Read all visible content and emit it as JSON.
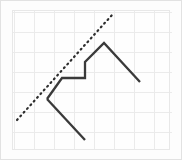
{
  "figure": {
    "width": 182,
    "height": 160,
    "background_color": "#fdfdfd",
    "plot_background_color": "#fefefe",
    "border_color": "#e2e2e2",
    "title": "",
    "caption": ""
  },
  "grid": {
    "visible": true,
    "spacing_px": 20,
    "color": "#ebebeb",
    "line_width": 1,
    "x_start": 14,
    "y_start": 12,
    "x_end": 170,
    "y_end": 148
  },
  "chart_data": {
    "type": "line",
    "title": "",
    "subtitle": "",
    "xlabel": "",
    "ylabel": "",
    "xlim": [
      0,
      182
    ],
    "ylim": [
      160,
      0
    ],
    "grid": true,
    "legend_position": "none",
    "tick_labels_visible": false,
    "x_ticks": [
      14,
      34,
      54,
      74,
      94,
      114,
      134,
      154,
      170
    ],
    "y_ticks": [
      12,
      32,
      52,
      72,
      92,
      112,
      132,
      148
    ],
    "series": [
      {
        "name": "zigzag-polyline",
        "style": "solid",
        "color": "#3a3a3a",
        "line_width": 2.3,
        "marker": "none",
        "points": [
          [
            47,
            99
          ],
          [
            62,
            78
          ],
          [
            85,
            78
          ],
          [
            85,
            62
          ],
          [
            104,
            43
          ],
          [
            140,
            82
          ]
        ]
      },
      {
        "name": "lower-tail",
        "style": "solid",
        "color": "#3a3a3a",
        "line_width": 2.3,
        "marker": "none",
        "points": [
          [
            47,
            99
          ],
          [
            85,
            140
          ]
        ]
      },
      {
        "name": "dotted-trend-line",
        "style": "dotted",
        "color": "#2e2e2e",
        "line_width": 2.2,
        "dash_pattern": "1,4",
        "marker": "none",
        "points": [
          [
            17,
            120
          ],
          [
            112,
            15
          ]
        ]
      }
    ],
    "annotations": []
  }
}
